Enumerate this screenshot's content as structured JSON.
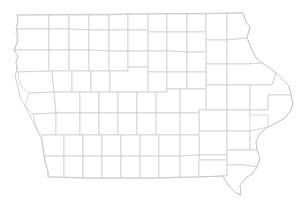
{
  "map": {
    "subject": "Iowa county boundaries",
    "county_count": 99,
    "labels_visible": false,
    "colors": {
      "background": "#ffffff",
      "county_fill": "#ffffff",
      "boundary_stroke": "#c8c8c8"
    }
  }
}
